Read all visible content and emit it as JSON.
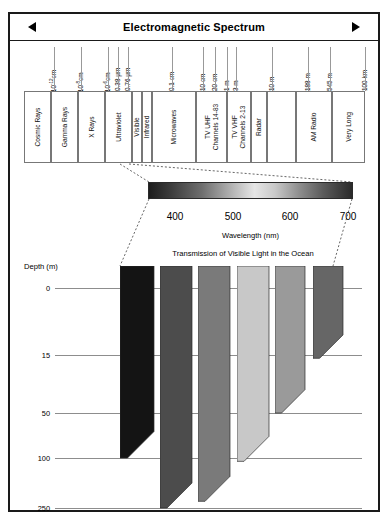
{
  "header": {
    "title": "Electromagnetic Spectrum",
    "left_arrow": "left-arrow",
    "right_arrow": "right-arrow"
  },
  "spectrum": {
    "bands": [
      {
        "label": "Cosmic Rays"
      },
      {
        "label": "Gamma Rays"
      },
      {
        "label": "X Rays"
      },
      {
        "label": "Ultraviolet"
      },
      {
        "label": "Visible"
      },
      {
        "label": "Infrared"
      },
      {
        "label": "Microwaves"
      },
      {
        "label": "TV UHF\nChannels 14-83"
      },
      {
        "label": "TV VHF\nChannels 2-13"
      },
      {
        "label": "Radar"
      },
      {
        "label": ""
      },
      {
        "label": "AM Radio"
      },
      {
        "label": "Very Long"
      }
    ],
    "scale_labels": [
      {
        "text": "10",
        "sup": "-12",
        "unit": "cm"
      },
      {
        "text": "10",
        "sup": "-8",
        "unit": "cm"
      },
      {
        "text": "10",
        "sup": "-6",
        "unit": "cm"
      },
      {
        "text": "0.38",
        "sup": "",
        "unit": "μm"
      },
      {
        "text": "0.76",
        "sup": "",
        "unit": "μm"
      },
      {
        "text": "0.1",
        "sup": "",
        "unit": "cm"
      },
      {
        "text": "10",
        "sup": "",
        "unit": "cm"
      },
      {
        "text": "20",
        "sup": "",
        "unit": "cm"
      },
      {
        "text": "1",
        "sup": "",
        "unit": "m"
      },
      {
        "text": "3",
        "sup": "",
        "unit": "m"
      },
      {
        "text": "10",
        "sup": "",
        "unit": "m"
      },
      {
        "text": "188",
        "sup": "",
        "unit": "m"
      },
      {
        "text": "545",
        "sup": "",
        "unit": "m"
      },
      {
        "text": "100",
        "sup": "",
        "unit": "km"
      }
    ]
  },
  "wavelength_axis": {
    "caption": "Wavelength (nm)",
    "ticks": [
      "400",
      "500",
      "600",
      "700"
    ]
  },
  "chart_data": {
    "type": "bar",
    "title": "Transmission of Visible Light in the Ocean",
    "xlabel": "",
    "ylabel": "Depth (m)",
    "ylim": [
      0,
      250
    ],
    "grid": true,
    "legend": "none",
    "categories": [
      "violet",
      "blue",
      "green",
      "yellow",
      "orange",
      "red"
    ],
    "category_colors": [
      "#141414",
      "#4c4c4c",
      "#7a7a7a",
      "#c8c8c8",
      "#9a9a9a",
      "#666666"
    ],
    "values": [
      100,
      260,
      230,
      110,
      50,
      17
    ],
    "value_label": "penetration depth (m)",
    "ytick_labels": [
      "0",
      "15",
      "50",
      "100",
      "250"
    ],
    "ytick_values": [
      0,
      15,
      50,
      100,
      250
    ]
  },
  "depth_axis": {
    "title": "Depth (m)",
    "ticks": [
      "0",
      "15",
      "50",
      "100",
      "250"
    ]
  }
}
